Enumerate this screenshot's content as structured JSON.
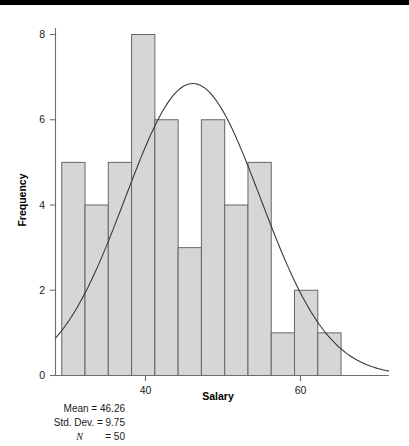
{
  "figure": {
    "background_color": "#ffffff",
    "top_band_color": "#000000",
    "bar_fill_color": "#d6d6d6",
    "bar_stroke_color": "#666666",
    "axis_color": "#6e6e6e",
    "curve_color": "#3a3a3a"
  },
  "footer": {
    "mean_line": "Mean = 46.26",
    "std_dev_line": "Std. Dev. = 9.75",
    "n_symbol": "N",
    "n_line": " = 50"
  },
  "chart_data": {
    "type": "bar",
    "title": "",
    "subtitle": "",
    "xlabel": "Salary",
    "ylabel": "Frequency",
    "grid": false,
    "legend": "none",
    "overlay": "normal-distribution-curve",
    "xlim": [
      26.5,
      74.5
    ],
    "ylim": [
      0,
      8.6
    ],
    "xticks": [
      40,
      60
    ],
    "xtick_labels": [
      "40",
      "60"
    ],
    "yticks": [
      0,
      2,
      4,
      6,
      8
    ],
    "ytick_labels": [
      "0",
      "2",
      "4",
      "6",
      "8"
    ],
    "bin_width": 3.35,
    "bin_starts": [
      27.4,
      30.75,
      34.1,
      37.45,
      40.8,
      44.15,
      47.5,
      50.85,
      54.2,
      57.55,
      60.9,
      64.25
    ],
    "bin_centers": [
      29.1,
      32.4,
      35.8,
      39.1,
      42.5,
      45.8,
      49.2,
      52.5,
      55.9,
      59.2,
      62.6,
      65.9
    ],
    "categories": [
      "27-31",
      "31-34",
      "34-37",
      "37-41",
      "41-44",
      "44-47",
      "47-51",
      "51-54",
      "54-58",
      "58-61",
      "61-64",
      "64-68"
    ],
    "values": [
      5,
      4,
      5,
      8,
      6,
      3,
      6,
      4,
      5,
      1,
      2,
      1
    ],
    "statistics": {
      "mean": 46.26,
      "std_dev": 9.75,
      "n": 50
    },
    "curve": {
      "type": "normal",
      "mean": 46.26,
      "std_dev": 9.75,
      "peak_frequency": 6.85
    }
  }
}
